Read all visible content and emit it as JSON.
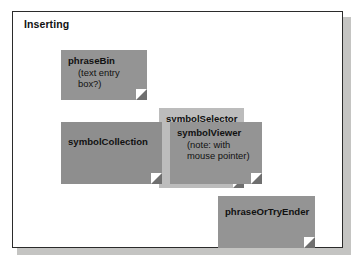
{
  "diagram": {
    "frame_title": "Inserting",
    "colors": {
      "frame_border": "#2b2b2b",
      "frame_background": "#ffffff",
      "frame_shadow": "#b0b0ae",
      "note_dark": "#949494",
      "note_mid": "#8e8e8e",
      "note_light": "#bcbcbc",
      "text": "#111111"
    },
    "notes": [
      {
        "id": "phraseBin",
        "title": "phraseBin",
        "sub": "(text entry box?)",
        "fill": "#949494"
      },
      {
        "id": "symbolCollection",
        "title": "symbolCollection",
        "sub": "",
        "fill": "#8e8e8e"
      },
      {
        "id": "symbolSelector",
        "title": "symbolSelector",
        "sub": "",
        "fill": "#bcbcbc"
      },
      {
        "id": "symbolViewer",
        "title": "symbolViewer",
        "sub": "(note: with mouse pointer)",
        "fill": "#949494"
      },
      {
        "id": "phraseOrTryEnder",
        "title": "phraseOrTryEnder",
        "sub": "",
        "fill": "#949494"
      }
    ]
  }
}
